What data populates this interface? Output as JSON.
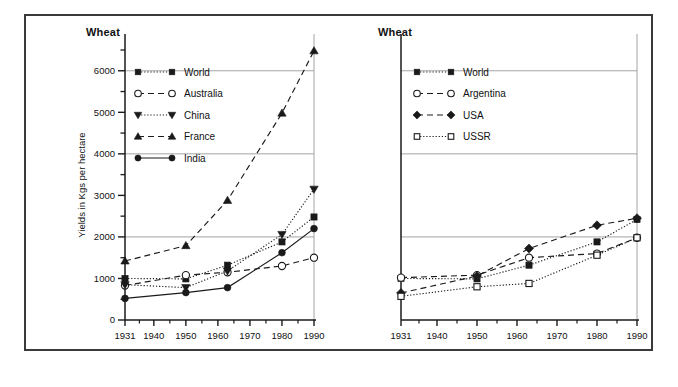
{
  "figure": {
    "background_color": "#ffffff",
    "frame_color": "#3a3a3a",
    "ink_color": "#1a1a1a",
    "gridline_color": "#9a9a9a"
  },
  "panels": [
    {
      "id": "left",
      "title": "Wheat",
      "y_axis_label": "Yields in Kgs per hectare"
    },
    {
      "id": "right",
      "title": "Wheat",
      "y_axis_label": ""
    }
  ],
  "chart_data": [
    {
      "type": "line",
      "title": "Wheat",
      "xlabel": "",
      "ylabel": "Yields in Kgs per hectare",
      "x": [
        1931,
        1950,
        1963,
        1980,
        1990
      ],
      "xlim": [
        1931,
        1990
      ],
      "ylim": [
        0,
        6500
      ],
      "xticks": [
        1931,
        1940,
        1950,
        1960,
        1970,
        1980,
        1990
      ],
      "xticklabels": [
        "1931",
        "1940",
        "1950",
        "1960",
        "1970",
        "1980",
        "1990"
      ],
      "yticks": [
        0,
        1000,
        2000,
        3000,
        4000,
        5000,
        6000
      ],
      "yticklabels": [
        "0",
        "1000",
        "2000",
        "3000",
        "4000",
        "5000",
        "6000"
      ],
      "yticks_minor": [
        500,
        1500,
        2500,
        3500,
        4500,
        5500,
        6500
      ],
      "grid": "horizontal-major",
      "legend_position": "upper-left",
      "series": [
        {
          "name": "World",
          "marker": "square-filled",
          "linestyle": "dotted",
          "values": [
            1000,
            990,
            1320,
            1880,
            2480
          ]
        },
        {
          "name": "Australia",
          "marker": "circle-open",
          "linestyle": "dashed",
          "values": [
            830,
            1080,
            1150,
            1300,
            1500
          ]
        },
        {
          "name": "China",
          "marker": "triangle-down-filled",
          "linestyle": "dotted",
          "values": [
            850,
            780,
            1180,
            2060,
            3150
          ]
        },
        {
          "name": "France",
          "marker": "triangle-up-filled",
          "linestyle": "dashed",
          "values": [
            1420,
            1790,
            2880,
            4980,
            6480
          ]
        },
        {
          "name": "India",
          "marker": "circle-filled",
          "linestyle": "solid",
          "values": [
            520,
            660,
            780,
            1620,
            2200
          ]
        }
      ]
    },
    {
      "type": "line",
      "title": "Wheat",
      "xlabel": "",
      "ylabel": "",
      "x": [
        1931,
        1950,
        1963,
        1980,
        1990
      ],
      "xlim": [
        1931,
        1990
      ],
      "ylim": [
        0,
        6500
      ],
      "xticks": [
        1931,
        1940,
        1950,
        1960,
        1970,
        1980,
        1990
      ],
      "xticklabels": [
        "1931",
        "1940",
        "1950",
        "1960",
        "1970",
        "1980",
        "1990"
      ],
      "yticks": [
        0,
        1000,
        2000,
        3000,
        4000,
        5000,
        6000
      ],
      "yticklabels": [
        "0",
        "1000",
        "2000",
        "3000",
        "4000",
        "5000",
        "6000"
      ],
      "yticks_minor": [
        500,
        1500,
        2500,
        3500,
        4500,
        5500,
        6500
      ],
      "grid": "horizontal-major",
      "legend_position": "upper-left",
      "series": [
        {
          "name": "World",
          "marker": "square-filled",
          "linestyle": "dotted",
          "values": [
            1000,
            990,
            1320,
            1880,
            2420
          ]
        },
        {
          "name": "Argentina",
          "marker": "circle-open",
          "linestyle": "dashed",
          "values": [
            1020,
            1080,
            1500,
            1600,
            1980
          ]
        },
        {
          "name": "USA",
          "marker": "diamond-filled",
          "linestyle": "dashed",
          "values": [
            650,
            1060,
            1720,
            2280,
            2450
          ]
        },
        {
          "name": "USSR",
          "marker": "square-open",
          "linestyle": "dotted",
          "values": [
            570,
            800,
            880,
            1560,
            1980
          ]
        }
      ]
    }
  ]
}
